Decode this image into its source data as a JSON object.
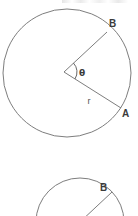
{
  "figure": {
    "title": "Circle sector with central angle theta and radius r",
    "background_color": "#ffffff",
    "stroke_color": "#6e6e6e",
    "label_color": "#3b3b3b",
    "width": 138,
    "height": 216
  },
  "top_circle": {
    "name": "upper-circle-diagram",
    "center": {
      "x": 67,
      "y": 73
    },
    "radius": 64,
    "labels": {
      "point_b": "B",
      "point_a": "A",
      "radius": "r",
      "angle": "θ"
    },
    "label_positions": {
      "point_b": {
        "x": 109,
        "y": 27
      },
      "point_a": {
        "x": 122,
        "y": 117
      },
      "radius": {
        "x": 89,
        "y": 104
      },
      "angle": {
        "x": 79,
        "y": 76
      }
    },
    "radii": [
      {
        "name": "radius-to-b",
        "from": {
          "x": 64,
          "y": 72
        },
        "to": {
          "x": 107,
          "y": 32
        }
      },
      {
        "name": "radius-to-a",
        "from": {
          "x": 64,
          "y": 72
        },
        "to": {
          "x": 121,
          "y": 108
        }
      }
    ],
    "angle_arc": {
      "name": "central-angle-arc",
      "center": {
        "x": 64,
        "y": 72
      },
      "radius": 13,
      "start_angle_deg": -43,
      "end_angle_deg": 32
    }
  },
  "bottom_circle": {
    "name": "lower-circle-diagram-cropped",
    "center": {
      "x": 80,
      "y": 222
    },
    "radius": 44,
    "labels": {
      "point_b": "B"
    },
    "label_positions": {
      "point_b": {
        "x": 100,
        "y": 191
      }
    },
    "radii": [
      {
        "name": "radius-to-b",
        "from": {
          "x": 80,
          "y": 222
        },
        "to": {
          "x": 112,
          "y": 192
        }
      }
    ]
  },
  "chart_data": {
    "type": "diagram",
    "shapes": [
      {
        "kind": "circle",
        "id": "top-circle",
        "cx": 67,
        "cy": 73,
        "r": 64
      },
      {
        "kind": "segment",
        "id": "top-radius-ob",
        "x1": 64,
        "y1": 72,
        "x2": 107,
        "y2": 32,
        "label": "B"
      },
      {
        "kind": "segment",
        "id": "top-radius-oa",
        "x1": 64,
        "y1": 72,
        "x2": 121,
        "y2": 108,
        "label": "r / A"
      },
      {
        "kind": "arc",
        "id": "theta-arc",
        "cx": 64,
        "cy": 72,
        "r": 13,
        "start_deg": -43,
        "end_deg": 32,
        "label": "θ"
      },
      {
        "kind": "circle",
        "id": "bottom-circle",
        "cx": 80,
        "cy": 222,
        "r": 44,
        "note": "cropped by lower edge of image"
      },
      {
        "kind": "segment",
        "id": "bottom-radius-ob",
        "x1": 80,
        "y1": 222,
        "x2": 112,
        "y2": 192,
        "label": "B"
      }
    ],
    "annotations": [
      "B",
      "A",
      "r",
      "θ",
      "B"
    ]
  }
}
